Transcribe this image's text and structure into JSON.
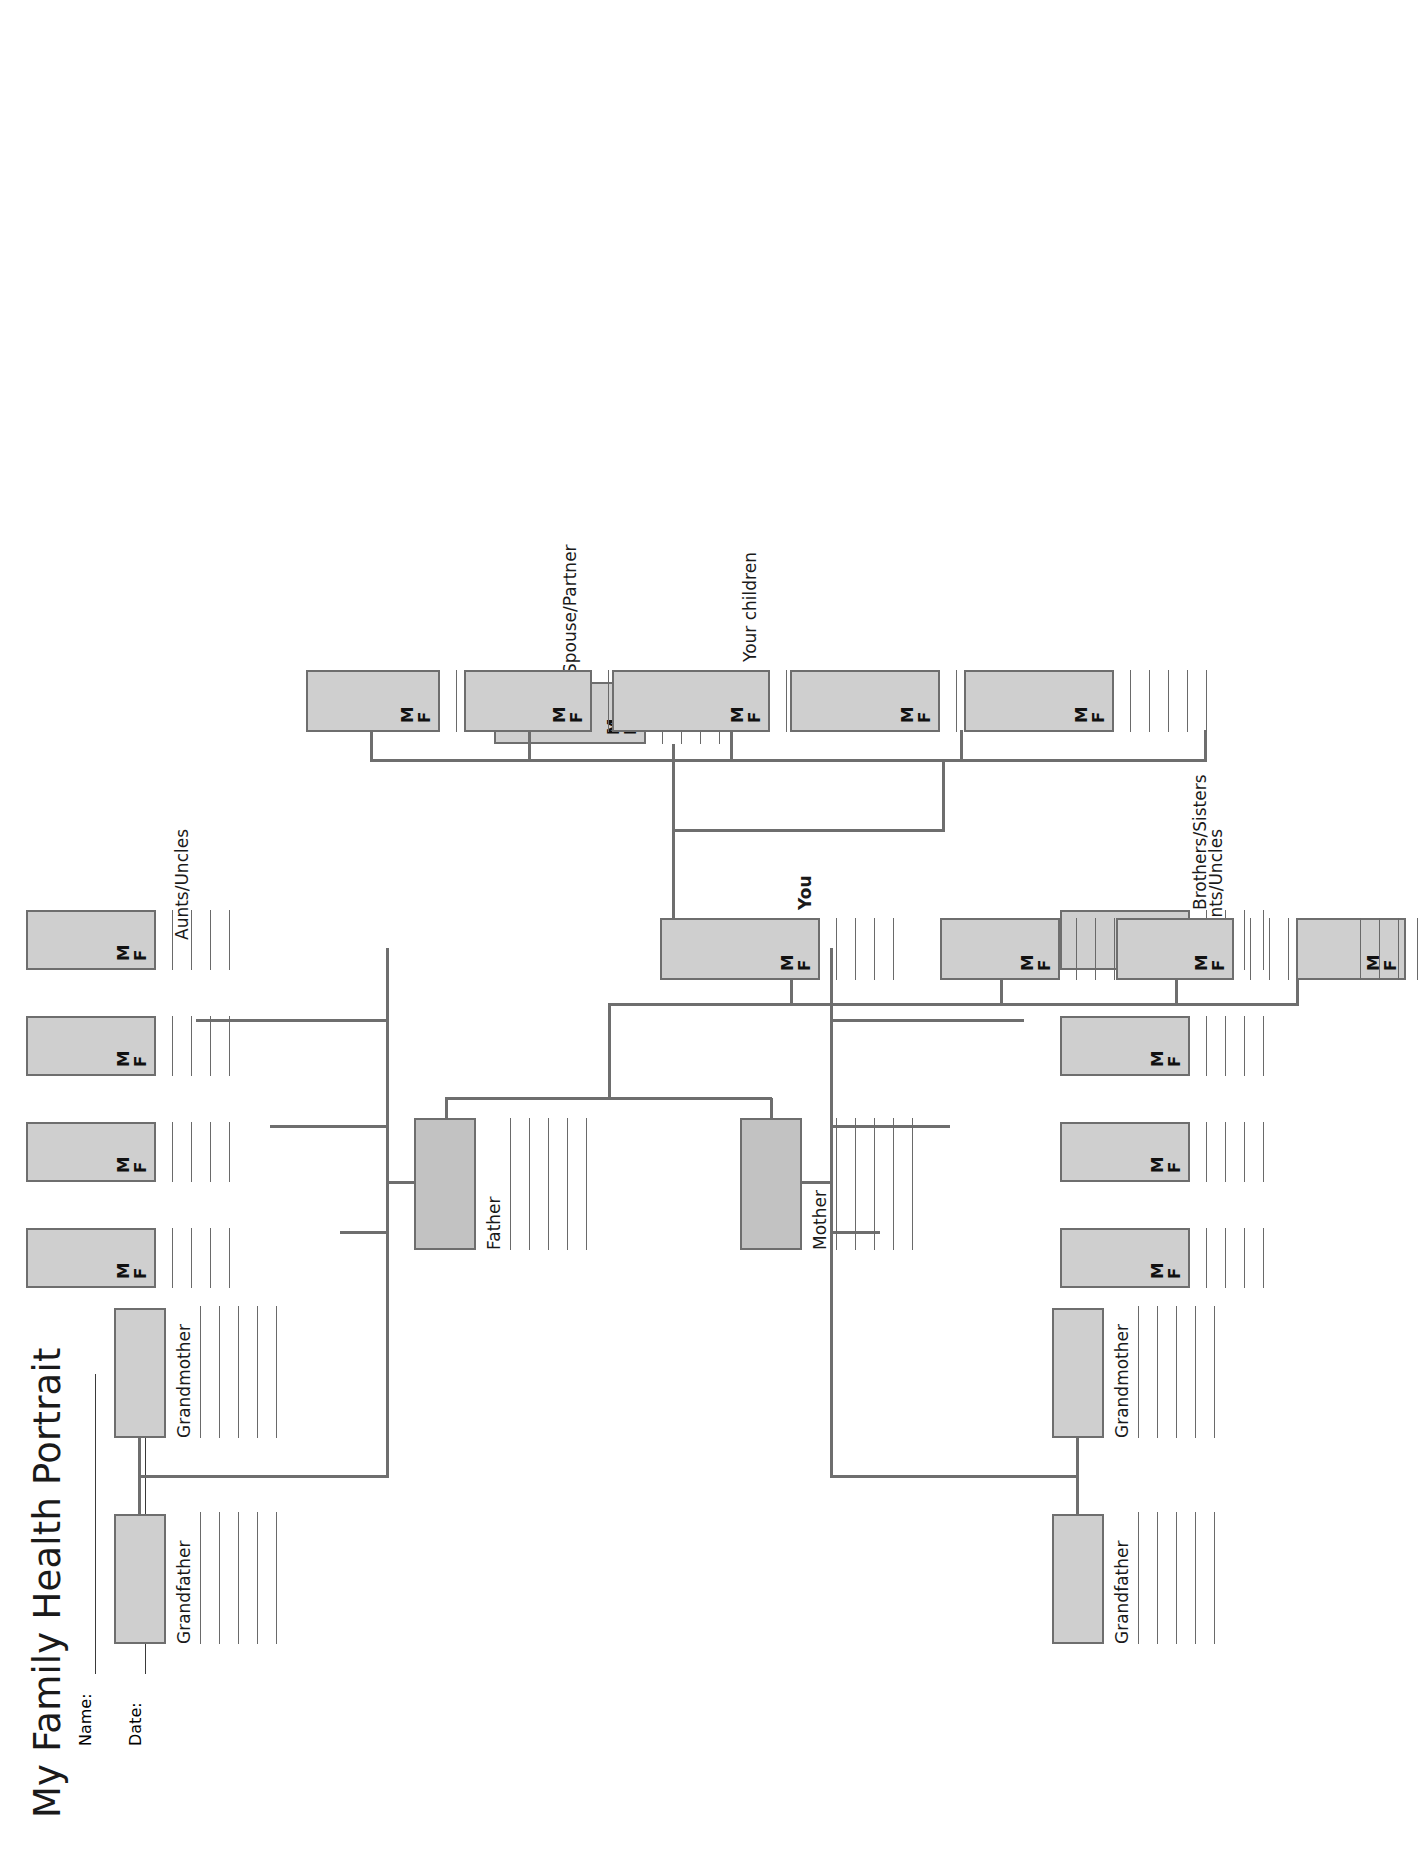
{
  "document": {
    "title": "My Family Health Portrait",
    "page_type": "family-health-history-pedigree-worksheet"
  },
  "meta_fields": [
    {
      "label": "Name:",
      "value": ""
    },
    {
      "label": "Date:",
      "value": ""
    }
  ],
  "labels": {
    "grandfather": "Grandfather",
    "grandmother": "Grandmother",
    "aunts_uncles": "Aunts/Uncles",
    "father": "Father",
    "mother": "Mother",
    "you": "You",
    "spouse_partner": "Spouse/Partner",
    "brothers_sisters": "Brothers/Sisters",
    "your_children": "Your children"
  },
  "sex_markers": {
    "male": "M",
    "female": "F"
  },
  "colors": {
    "box_fill": "#cfcfcf",
    "box_fill_parent": "#c2c2c2",
    "box_border": "#6e6e6e",
    "connector": "#6e6e6e",
    "rule_line": "#6a6a6a",
    "text": "#1a1a1a",
    "page_background": "#ffffff"
  },
  "generations": {
    "paternal_grandparents": [
      {
        "role": "Grandfather",
        "side": "paternal",
        "note_lines": 5
      },
      {
        "role": "Grandmother",
        "side": "paternal",
        "note_lines": 5
      }
    ],
    "maternal_grandparents": [
      {
        "role": "Grandfather",
        "side": "maternal",
        "note_lines": 5
      },
      {
        "role": "Grandmother",
        "side": "maternal",
        "note_lines": 5
      }
    ],
    "paternal_aunts_uncles": [
      {
        "sex_options": [
          "M",
          "F"
        ],
        "note_lines": 4
      },
      {
        "sex_options": [
          "M",
          "F"
        ],
        "note_lines": 4
      },
      {
        "sex_options": [
          "M",
          "F"
        ],
        "note_lines": 4
      },
      {
        "sex_options": [
          "M",
          "F"
        ],
        "note_lines": 4
      }
    ],
    "maternal_aunts_uncles": [
      {
        "sex_options": [
          "M",
          "F"
        ],
        "note_lines": 4
      },
      {
        "sex_options": [
          "M",
          "F"
        ],
        "note_lines": 4
      },
      {
        "sex_options": [
          "M",
          "F"
        ],
        "note_lines": 4
      },
      {
        "sex_options": [
          "M",
          "F"
        ],
        "note_lines": 4
      }
    ],
    "parents": [
      {
        "role": "Father",
        "note_lines": 5
      },
      {
        "role": "Mother",
        "note_lines": 5
      }
    ],
    "self": {
      "role": "You",
      "sex_options": [
        "M",
        "F"
      ],
      "note_lines": 4
    },
    "spouse": {
      "role": "Spouse/Partner",
      "sex_options": [
        "M",
        "F"
      ],
      "note_lines": 4
    },
    "siblings": [
      {
        "sex_options": [
          "M",
          "F"
        ],
        "note_lines": 4
      },
      {
        "sex_options": [
          "M",
          "F"
        ],
        "note_lines": 4
      },
      {
        "sex_options": [
          "M",
          "F"
        ],
        "note_lines": 4
      }
    ],
    "children": [
      {
        "sex_options": [
          "M",
          "F"
        ],
        "note_lines": 5
      },
      {
        "sex_options": [
          "M",
          "F"
        ],
        "note_lines": 5
      },
      {
        "sex_options": [
          "M",
          "F"
        ],
        "note_lines": 5
      },
      {
        "sex_options": [
          "M",
          "F"
        ],
        "note_lines": 5
      },
      {
        "sex_options": [
          "M",
          "F"
        ],
        "note_lines": 5
      }
    ]
  }
}
